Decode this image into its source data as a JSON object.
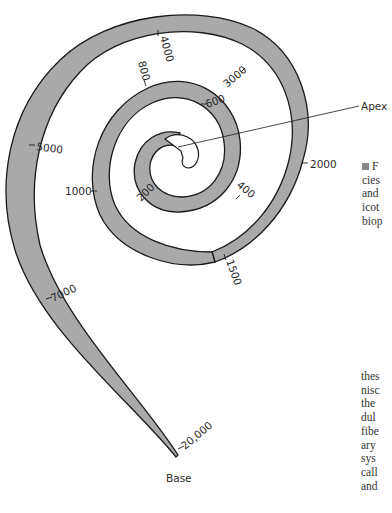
{
  "figure": {
    "colors": {
      "membrane_fill": "#a9a9a9",
      "outline": "#1a1a1a",
      "background": "#ffffff"
    },
    "end_labels": {
      "apex": "Apex",
      "base": "Base"
    },
    "frequency_labels": [
      {
        "id": "f200",
        "text": "200"
      },
      {
        "id": "f400",
        "text": "400"
      },
      {
        "id": "f600",
        "text": "600"
      },
      {
        "id": "f800",
        "text": "800"
      },
      {
        "id": "f1000",
        "text": "1000"
      },
      {
        "id": "f1500",
        "text": "1500"
      },
      {
        "id": "f2000",
        "text": "2000"
      },
      {
        "id": "f3000",
        "text": "3000"
      },
      {
        "id": "f4000",
        "text": "4000"
      },
      {
        "id": "f5000",
        "text": "5000"
      },
      {
        "id": "f7000",
        "text": "7000"
      },
      {
        "id": "f20000",
        "text": "20,000"
      }
    ]
  },
  "caption_fragment": [
    "F",
    "cies",
    "and",
    "icot",
    "biop"
  ],
  "body_text_fragment": [
    "thes",
    "nisc",
    "the",
    "dul",
    "fibe",
    "ary",
    "sys",
    "call",
    "and"
  ]
}
